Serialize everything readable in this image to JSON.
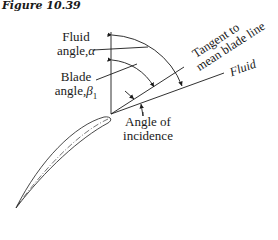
{
  "figure": {
    "title": "Figure 10.39"
  },
  "labels": {
    "fluid_angle_line1": "Fluid",
    "fluid_angle_line2": "angle,",
    "fluid_angle_symbol": "α",
    "blade_angle_line1": "Blade",
    "blade_angle_line2": "angle,",
    "blade_angle_symbol": "β",
    "blade_angle_subscript": "1",
    "tangent_line1": "Tangent to",
    "tangent_line2": "mean blade line",
    "fluid": "Fluid",
    "incidence_line1": "Angle of",
    "incidence_line2": "incidence"
  },
  "colors": {
    "ink": "#1a1a1a",
    "background": "#ffffff"
  }
}
